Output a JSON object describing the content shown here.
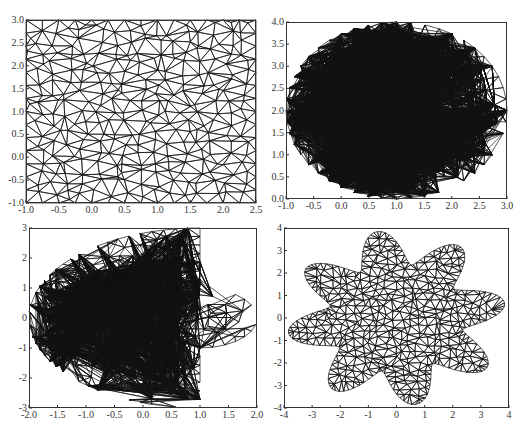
{
  "chart_data": [
    {
      "type": "mesh",
      "title": "",
      "description": "Triangular mesh of a rectangle",
      "shape": "rectangle",
      "xlim": [
        -1.0,
        2.5
      ],
      "ylim": [
        -1.0,
        3.0
      ],
      "xticks": [
        "-1.0",
        "-0.5",
        "0.0",
        "0.5",
        "1.0",
        "1.5",
        "2.0",
        "2.5"
      ],
      "yticks": [
        "-1.0",
        "-0.5",
        "0.0",
        "0.5",
        "1.0",
        "1.5",
        "2.0",
        "2.5",
        "3.0"
      ],
      "box": {
        "left": 26,
        "top": 20,
        "right": 256,
        "bottom": 203
      },
      "grid": false
    },
    {
      "type": "mesh",
      "title": "",
      "description": "Triangular mesh of an ellipse centered at (1,2)",
      "shape": "ellipse",
      "params": {
        "cx": 1.0,
        "cy": 2.0,
        "rx": 2.0,
        "ry": 2.0
      },
      "xlim": [
        -1.0,
        3.0
      ],
      "ylim": [
        0.0,
        4.0
      ],
      "xticks": [
        "-1.0",
        "-0.5",
        "0.0",
        "0.5",
        "1.0",
        "1.5",
        "2.0",
        "2.5",
        "3.0"
      ],
      "yticks": [
        "0.0",
        "0.5",
        "1.0",
        "1.5",
        "2.0",
        "2.5",
        "3.0",
        "3.5",
        "4.0"
      ],
      "box": {
        "left": 286,
        "top": 22,
        "right": 507,
        "bottom": 199
      },
      "grid": false
    },
    {
      "type": "mesh",
      "title": "",
      "description": "Triangular mesh of a half-ellipse with a rounded tab (union of half ellipse x<=1 and ellipse centered at 1,0)",
      "shape": "half-ellipse-with-tab",
      "params": {
        "big_cx": 1.0,
        "big_rx": 3.0,
        "big_ry": 3.0,
        "cut_x": 1.0,
        "tab_cx": 1.0,
        "tab_rx": 1.0,
        "tab_ry": 1.0
      },
      "xlim": [
        -2.0,
        2.0
      ],
      "ylim": [
        -3,
        3
      ],
      "xticks": [
        "-2.0",
        "-1.5",
        "-1.0",
        "-0.5",
        "0.0",
        "0.5",
        "1.0",
        "1.5",
        "2.0"
      ],
      "yticks": [
        "-3",
        "-2",
        "-1",
        "0",
        "1",
        "2",
        "3"
      ],
      "box": {
        "left": 29,
        "top": 228,
        "right": 257,
        "bottom": 408
      },
      "grid": false
    },
    {
      "type": "mesh",
      "title": "",
      "description": "Triangular mesh of an 8-petal star/flower shape",
      "shape": "star",
      "params": {
        "petals": 8,
        "r_base": 2.4,
        "r_amp": 1.5,
        "rotation_deg": 100
      },
      "xlim": [
        -4,
        4
      ],
      "ylim": [
        -4,
        4
      ],
      "xticks": [
        "-4",
        "-3",
        "-2",
        "-1",
        "0",
        "1",
        "2",
        "3",
        "4"
      ],
      "yticks": [
        "-4",
        "-3",
        "-2",
        "-1",
        "0",
        "1",
        "2",
        "3",
        "4"
      ],
      "box": {
        "left": 284,
        "top": 228,
        "right": 509,
        "bottom": 408
      },
      "grid": false
    }
  ],
  "style": {
    "line_color": "#111111",
    "axis_color": "#333333",
    "label_color": "#333333",
    "background": "#ffffff"
  }
}
